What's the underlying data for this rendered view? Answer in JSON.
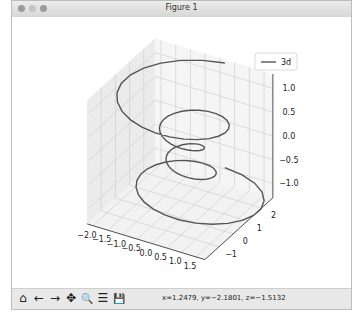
{
  "window": {
    "title": "Figure 1"
  },
  "toolbar": {
    "buttons": [
      {
        "name": "home",
        "glyph": "⌂"
      },
      {
        "name": "back",
        "glyph": "←"
      },
      {
        "name": "forward",
        "glyph": "→"
      },
      {
        "name": "pan",
        "glyph": "✥"
      },
      {
        "name": "zoom",
        "glyph": "🔍"
      },
      {
        "name": "configure-subplots",
        "glyph": "☰"
      },
      {
        "name": "save",
        "glyph": "💾"
      }
    ],
    "coords": "x=1.2479, y=−2.1801, z=−1.5132"
  },
  "chart_data": {
    "type": "line",
    "projection": "3d",
    "title": "",
    "legend": {
      "entries": [
        "3d"
      ],
      "placement": "top-right"
    },
    "series": [
      {
        "name": "3d",
        "color": "#555555",
        "equation": "theta in [-4pi, 4pi], z in [-2, 2] linear, r = z^2 + 1, x = r sin(theta), y = r cos(theta)",
        "n_points": 100
      }
    ],
    "axes": {
      "x": {
        "ticks": [
          "−2.0",
          "−1.5",
          "−1.0",
          "−0.5",
          "0.0",
          "0.5",
          "1.0",
          "1.5"
        ],
        "lim": [
          -2.2,
          1.8
        ]
      },
      "y": {
        "ticks": [
          "−1",
          "0",
          "1",
          "2"
        ],
        "lim": [
          -2.0,
          2.8
        ]
      },
      "z": {
        "ticks": [
          "−1.0",
          "−0.5",
          "0.0",
          "0.5",
          "1.0"
        ],
        "lim": [
          -1.3,
          1.3
        ]
      }
    },
    "view": {
      "elev": 30,
      "azim": -60
    },
    "grid": true
  }
}
